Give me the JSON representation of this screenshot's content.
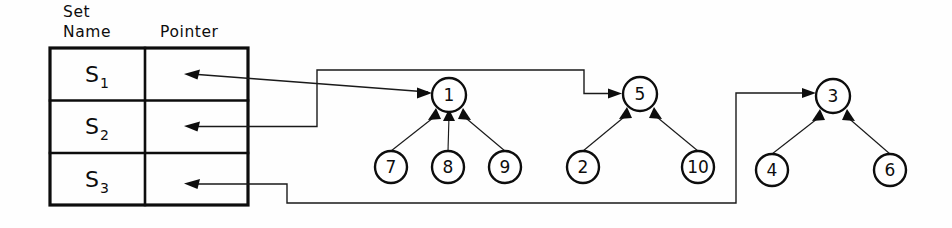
{
  "figure": {
    "background_color": "#fefefe",
    "ink_color": "#0d0d0d"
  },
  "table": {
    "headers": {
      "set_name_line1": "Set",
      "set_name_line2": "Name",
      "pointer": "Pointer"
    },
    "rows": [
      {
        "set_base": "S",
        "set_sub": "1",
        "pointer_target": "1"
      },
      {
        "set_base": "S",
        "set_sub": "2",
        "pointer_target": "5"
      },
      {
        "set_base": "S",
        "set_sub": "3",
        "pointer_target": "3"
      }
    ]
  },
  "trees": [
    {
      "name": "tree-s1",
      "root": {
        "label": "1",
        "cx": 449,
        "cy": 95,
        "r": 17
      },
      "children": [
        {
          "label": "7",
          "cx": 391,
          "cy": 167,
          "r": 16
        },
        {
          "label": "8",
          "cx": 448,
          "cy": 167,
          "r": 16
        },
        {
          "label": "9",
          "cx": 505,
          "cy": 167,
          "r": 16
        }
      ]
    },
    {
      "name": "tree-s2",
      "root": {
        "label": "5",
        "cx": 640,
        "cy": 94,
        "r": 17
      },
      "children": [
        {
          "label": "2",
          "cx": 583,
          "cy": 167,
          "r": 16
        },
        {
          "label": "10",
          "cx": 698,
          "cy": 167,
          "r": 16
        }
      ]
    },
    {
      "name": "tree-s3",
      "root": {
        "label": "3",
        "cx": 833,
        "cy": 96,
        "r": 17
      },
      "children": [
        {
          "label": "4",
          "cx": 772,
          "cy": 170,
          "r": 16
        },
        {
          "label": "6",
          "cx": 890,
          "cy": 170,
          "r": 16
        }
      ]
    }
  ],
  "pointers": [
    {
      "name": "pointer-s1-to-node1",
      "from_row": 1,
      "to_node": "1"
    },
    {
      "name": "pointer-s2-to-node5",
      "from_row": 2,
      "to_node": "5"
    },
    {
      "name": "pointer-s3-to-node3",
      "from_row": 3,
      "to_node": "3"
    }
  ]
}
